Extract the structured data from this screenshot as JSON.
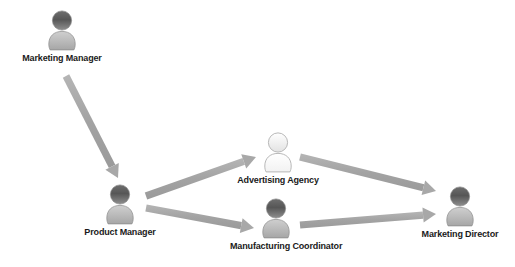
{
  "diagram": {
    "background_color": "#ffffff",
    "arrow_color": "#a8a8a8",
    "label_color": "#1a1a1a",
    "nodes": [
      {
        "id": "marketing-manager",
        "label": "Marketing Manager",
        "icon": "person-icon",
        "style": "filled",
        "x": 62,
        "y": 8
      },
      {
        "id": "product-manager",
        "label": "Product Manager",
        "icon": "person-icon",
        "style": "filled",
        "x": 120,
        "y": 182
      },
      {
        "id": "advertising-agency",
        "label": "Advertising Agency",
        "icon": "person-icon",
        "style": "outline",
        "x": 278,
        "y": 130
      },
      {
        "id": "manufacturing-coordinator",
        "label": "Manufacturing Coordinator",
        "icon": "person-icon",
        "style": "filled",
        "x": 276,
        "y": 196
      },
      {
        "id": "marketing-director",
        "label": "Marketing Director",
        "icon": "person-icon",
        "style": "filled",
        "x": 460,
        "y": 184
      }
    ],
    "edges": [
      {
        "id": "edge-mm-pm",
        "from": "marketing-manager",
        "to": "product-manager",
        "x1": 66,
        "y1": 76,
        "x2": 118,
        "y2": 178
      },
      {
        "id": "edge-pm-aa",
        "from": "product-manager",
        "to": "advertising-agency",
        "x1": 146,
        "y1": 196,
        "x2": 256,
        "y2": 157
      },
      {
        "id": "edge-pm-mc",
        "from": "product-manager",
        "to": "manufacturing-coordinator",
        "x1": 146,
        "y1": 208,
        "x2": 254,
        "y2": 228
      },
      {
        "id": "edge-aa-md",
        "from": "advertising-agency",
        "to": "marketing-director",
        "x1": 300,
        "y1": 157,
        "x2": 436,
        "y2": 191
      },
      {
        "id": "edge-mc-md",
        "from": "manufacturing-coordinator",
        "to": "marketing-director",
        "x1": 300,
        "y1": 225,
        "x2": 436,
        "y2": 214
      }
    ]
  }
}
